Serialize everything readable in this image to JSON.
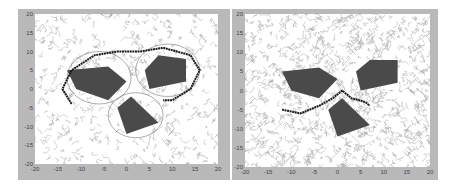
{
  "chart_data": [
    {
      "type": "scatter",
      "title": "",
      "xlabel": "",
      "ylabel": "",
      "xlim": [
        -20,
        20
      ],
      "ylim": [
        -20,
        20
      ],
      "x_ticks": [
        "-20",
        "-15",
        "-10",
        "-5",
        "0",
        "5",
        "10",
        "15",
        "20"
      ],
      "y_ticks": [
        "20",
        "15",
        "10",
        "5",
        "0",
        "-5",
        "-10",
        "-15",
        "-20"
      ],
      "grid": false,
      "obstacles": [
        {
          "name": "left-obstacle",
          "polygon": [
            [
              -13,
              5
            ],
            [
              -4,
              6
            ],
            [
              0,
              2
            ],
            [
              -4,
              -3
            ],
            [
              -11,
              0
            ]
          ]
        },
        {
          "name": "right-obstacle",
          "polygon": [
            [
              7,
              9
            ],
            [
              13,
              8
            ],
            [
              13,
              2
            ],
            [
              5,
              0
            ],
            [
              4,
              5
            ]
          ]
        },
        {
          "name": "bottom-obstacle",
          "polygon": [
            [
              1,
              -2
            ],
            [
              7,
              -9
            ],
            [
              0,
              -12
            ],
            [
              -2,
              -5
            ]
          ]
        }
      ],
      "safety_circles": [
        {
          "cx": -6,
          "cy": 3,
          "r": 7
        },
        {
          "cx": 9,
          "cy": 5,
          "r": 7
        },
        {
          "cx": 2,
          "cy": -7,
          "r": 6
        }
      ],
      "path": {
        "description": "long path looping above obstacles",
        "points": [
          [
            -12,
            -4
          ],
          [
            -14,
            0
          ],
          [
            -12,
            5
          ],
          [
            -7,
            9
          ],
          [
            -2,
            10
          ],
          [
            3,
            10
          ],
          [
            8,
            11
          ],
          [
            14,
            9
          ],
          [
            16,
            5
          ],
          [
            14,
            0
          ],
          [
            10,
            -3
          ],
          [
            8,
            -3
          ]
        ]
      },
      "tree": "dense random exploration tree (gray)"
    },
    {
      "type": "scatter",
      "title": "",
      "xlabel": "",
      "ylabel": "",
      "xlim": [
        -20,
        20
      ],
      "ylim": [
        -20,
        20
      ],
      "x_ticks": [
        "-20",
        "-15",
        "-10",
        "-5",
        "0",
        "5",
        "10",
        "15",
        "20"
      ],
      "y_ticks": [
        "20",
        "15",
        "10",
        "5",
        "0",
        "-5",
        "-10",
        "-15",
        "-20"
      ],
      "grid": false,
      "obstacles": [
        {
          "name": "left-obstacle",
          "polygon": [
            [
              -12,
              5
            ],
            [
              -4,
              6
            ],
            [
              0,
              3
            ],
            [
              -4,
              -2
            ],
            [
              -10,
              0
            ]
          ]
        },
        {
          "name": "right-obstacle",
          "polygon": [
            [
              7,
              8
            ],
            [
              13,
              8
            ],
            [
              13,
              2
            ],
            [
              5,
              0
            ],
            [
              4,
              5
            ]
          ]
        },
        {
          "name": "bottom-obstacle",
          "polygon": [
            [
              1,
              -2
            ],
            [
              7,
              -9
            ],
            [
              0,
              -12
            ],
            [
              -2,
              -5
            ]
          ]
        }
      ],
      "path": {
        "description": "short path between obstacles",
        "points": [
          [
            -12,
            -5
          ],
          [
            -8,
            -6
          ],
          [
            -4,
            -4
          ],
          [
            -1,
            -2
          ],
          [
            1,
            0
          ],
          [
            3,
            -2
          ],
          [
            6,
            -3
          ],
          [
            7,
            -4
          ]
        ]
      },
      "tree": "very dense exploration tree (gray)"
    }
  ],
  "colors": {
    "frame": "#b9b9b9",
    "plot_bg": "#ffffff",
    "obstacle": "#4a4a4a",
    "tree": "#a8a8a8",
    "path": "#1a1a1a",
    "circle": "#888888"
  }
}
